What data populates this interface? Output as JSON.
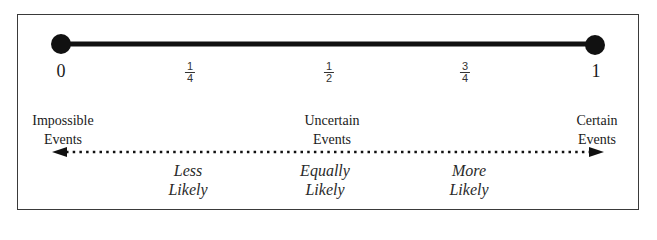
{
  "number_line": {
    "start_label": "0",
    "end_label": "1",
    "fractions": [
      {
        "num": "1",
        "den": "4"
      },
      {
        "num": "1",
        "den": "2"
      },
      {
        "num": "3",
        "den": "4"
      }
    ]
  },
  "events": {
    "impossible": [
      "Impossible",
      "Events"
    ],
    "uncertain": [
      "Uncertain",
      "Events"
    ],
    "certain": [
      "Certain",
      "Events"
    ]
  },
  "likelihood": {
    "less": [
      "Less",
      "Likely"
    ],
    "equally": [
      "Equally",
      "Likely"
    ],
    "more": [
      "More",
      "Likely"
    ]
  },
  "colors": {
    "line": "#111111",
    "border": "#3a3a3a"
  }
}
